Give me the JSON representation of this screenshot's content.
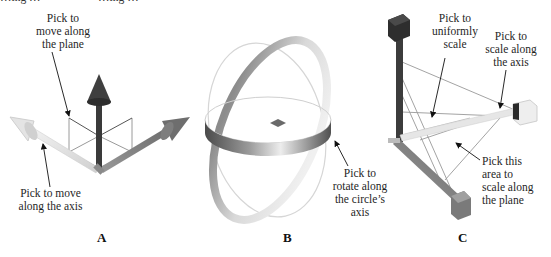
{
  "figure": {
    "clipped_top_text": "…ing …                    …ing …",
    "panels": [
      {
        "id": "A",
        "letter": "A",
        "title": "Translate gizmo",
        "labels": {
          "plane": "Pick to\nmove along\nthe plane",
          "axis": "Pick to move\nalong the axis"
        }
      },
      {
        "id": "B",
        "letter": "B",
        "title": "Rotate gizmo",
        "labels": {
          "circle": "Pick to\nrotate along\nthe circle’s\naxis"
        }
      },
      {
        "id": "C",
        "letter": "C",
        "title": "Scale gizmo",
        "labels": {
          "uniform": "Pick to\nuniformly\nscale",
          "axis": "Pick to\nscale along\nthe axis",
          "plane": "Pick this\narea to\nscale along\nthe plane"
        }
      }
    ],
    "colors": {
      "axis_dark": "#3a3a3a",
      "axis_mid": "#7a7a7a",
      "axis_light": "#e2e2e2",
      "plane_lines": "#b0b0b0",
      "ring_dark": "#6e6e6e",
      "ring_light": "#d8d8d8",
      "text": "#1f1f1f"
    }
  }
}
